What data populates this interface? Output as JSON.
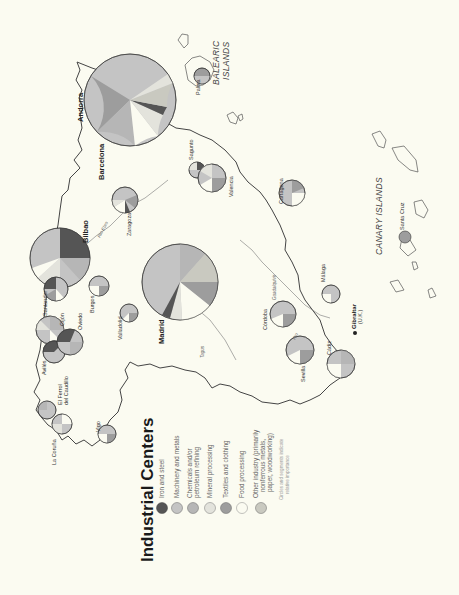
{
  "title": "Industrial Centers",
  "legend": {
    "items": [
      {
        "label": "Iron and steel",
        "color": "#555555"
      },
      {
        "label": "Machinery and metals",
        "color": "#c4c4c4"
      },
      {
        "label": "Chemicals and/or",
        "label2": "petroleum refining",
        "color": "#b6b6b6"
      },
      {
        "label": "Mineral processing",
        "color": "#e3e3dc"
      },
      {
        "label": "Textiles and clothing",
        "color": "#9d9d9d"
      },
      {
        "label": "Food processing",
        "color": "#fbfbf1"
      },
      {
        "label": "Other industry (primarily",
        "label2": "nonferrous metals,",
        "label3": "paper, woodworking)",
        "color": "#c9c9c0"
      }
    ],
    "note1": "Circles and segments indicate",
    "note2": "relative importance"
  },
  "regions": {
    "balearic1": "BALEARIC",
    "balearic2": "ISLANDS",
    "canary": "CANARY ISLANDS"
  },
  "rivers": {
    "ebro": "Rio Ebro",
    "tagus": "Tagus",
    "guadalquivir": "Guadalquivir",
    "rio": "Rio"
  },
  "cities": {
    "andorra": "Andorra",
    "barcelona": "Barcelona",
    "bilbao": "Bilbao",
    "madrid": "Madrid",
    "palma": "Palma",
    "sagunto": "Sagunto",
    "valencia": "Valencia",
    "cartagena": "Cartagena",
    "zaragoza": "Zaragoza",
    "santander": "Santander",
    "gijon": "Gijón",
    "oviedo": "Oviedo",
    "burgos": "Burgos",
    "valladolid": "Valladolid",
    "aviles": "Avilés",
    "el_ferrol1": "El Ferrol",
    "el_ferrol2": "del Caudillo",
    "la_coruna": "La Coruña",
    "vigo": "Vigo",
    "cordoba": "Córdoba",
    "malaga": "Málaga",
    "sevilla": "Sevilla",
    "cadiz": "Cádiz",
    "gibraltar": "Gibraltar",
    "gibraltar_note": "(U.K.)",
    "santa_cruz": "Santa Cruz"
  }
}
